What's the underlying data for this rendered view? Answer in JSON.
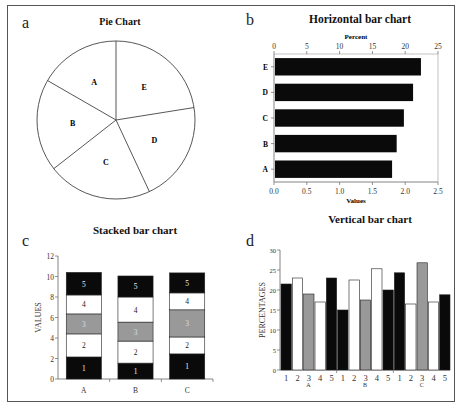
{
  "figure": {
    "panels": [
      {
        "letter": "a",
        "title": "Pie Chart"
      },
      {
        "letter": "b",
        "title": "Horizontal bar chart"
      },
      {
        "letter": "c",
        "title": "Stacked bar chart"
      },
      {
        "letter": "d",
        "title": "Vertical bar chart"
      }
    ]
  },
  "colors": {
    "black": "#0a0a0a",
    "white": "#ffffff",
    "gray": "#999999",
    "outline": "#444444"
  },
  "chart_data": [
    {
      "panel": "a",
      "type": "pie",
      "title": "Pie Chart",
      "categories": [
        "A",
        "B",
        "C",
        "D",
        "E"
      ],
      "values": [
        16.7,
        18.9,
        21.4,
        20.6,
        22.5
      ],
      "legend": "none (labels inside slices)"
    },
    {
      "panel": "b",
      "type": "bar",
      "orientation": "horizontal",
      "title": "Horizontal bar chart",
      "categories": [
        "A",
        "B",
        "C",
        "D",
        "E"
      ],
      "values": [
        1.8,
        1.87,
        1.98,
        2.12,
        2.24
      ],
      "xlabel": "Values",
      "x2label": "Percent",
      "xlim": [
        0,
        2.5
      ],
      "x2lim": [
        0,
        25
      ],
      "xticks": [
        "0.0",
        "0.5",
        "1.0",
        "1.5",
        "2.0",
        "2.5"
      ],
      "x2ticks": [
        "0",
        "5",
        "10",
        "15",
        "20",
        "25"
      ],
      "grid": false
    },
    {
      "panel": "c",
      "type": "bar",
      "stacked": true,
      "title": "Stacked bar chart",
      "categories": [
        "A",
        "B",
        "C"
      ],
      "ylabel": "VALUES",
      "ylim": [
        0,
        12
      ],
      "yticks": [
        "0",
        "2",
        "4",
        "6",
        "8",
        "10",
        "12"
      ],
      "series": [
        {
          "name": "1",
          "color": "black",
          "values": [
            2.15,
            1.55,
            2.45
          ]
        },
        {
          "name": "2",
          "color": "white",
          "values": [
            2.25,
            2.15,
            1.65
          ]
        },
        {
          "name": "3",
          "color": "gray",
          "values": [
            1.95,
            1.85,
            2.65
          ]
        },
        {
          "name": "4",
          "color": "white",
          "values": [
            1.85,
            2.45,
            1.65
          ]
        },
        {
          "name": "5",
          "color": "black",
          "values": [
            2.2,
            2.05,
            1.95
          ]
        }
      ]
    },
    {
      "panel": "d",
      "type": "bar",
      "title": "Vertical bar chart",
      "groups": [
        "A",
        "B",
        "C"
      ],
      "categories": [
        "1",
        "2",
        "3",
        "4",
        "5"
      ],
      "ylabel": "PERCENTAGES",
      "ylim": [
        0,
        30
      ],
      "yticks": [
        "0",
        "5",
        "10",
        "15",
        "20",
        "25",
        "30"
      ],
      "series": [
        {
          "name": "1",
          "color": "black",
          "values": [
            21.5,
            15.0,
            24.3
          ]
        },
        {
          "name": "2",
          "color": "white",
          "values": [
            23.0,
            22.5,
            16.5
          ]
        },
        {
          "name": "3",
          "color": "gray",
          "values": [
            19.0,
            17.5,
            26.8
          ]
        },
        {
          "name": "4",
          "color": "white",
          "values": [
            17.0,
            25.3,
            17.0
          ]
        },
        {
          "name": "5",
          "color": "black",
          "values": [
            23.0,
            20.0,
            18.8
          ]
        }
      ]
    }
  ]
}
